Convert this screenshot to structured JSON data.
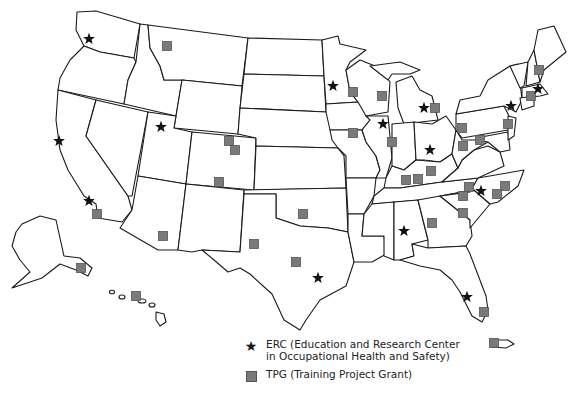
{
  "map": {
    "subject": "United States map with training program locations",
    "regions_shown": [
      "Contiguous United States",
      "Alaska",
      "Hawaii",
      "Puerto Rico"
    ]
  },
  "legend": {
    "items": [
      {
        "symbol": "star",
        "label_line1": "ERC (Education and Research Center",
        "label_line2": "in Occupational Health and Safety)"
      },
      {
        "symbol": "square",
        "label_line1": "TPG (Training Project Grant)"
      }
    ]
  },
  "colors": {
    "erc_marker": "#111111",
    "tpg_marker": "#7a7a7a",
    "state_border": "#1a1a1a",
    "background": "#ffffff"
  },
  "markers": {
    "erc": [
      {
        "region": "Washington",
        "x": 89,
        "y": 39
      },
      {
        "region": "Utah",
        "x": 161,
        "y": 127
      },
      {
        "region": "Northern California",
        "x": 59,
        "y": 141
      },
      {
        "region": "Southern California",
        "x": 89,
        "y": 201
      },
      {
        "region": "Minnesota",
        "x": 333,
        "y": 86
      },
      {
        "region": "Illinois",
        "x": 383,
        "y": 124
      },
      {
        "region": "Michigan",
        "x": 424,
        "y": 108
      },
      {
        "region": "Ohio",
        "x": 430,
        "y": 150
      },
      {
        "region": "New York",
        "x": 511,
        "y": 106
      },
      {
        "region": "Massachusetts",
        "x": 538,
        "y": 89
      },
      {
        "region": "North Carolina",
        "x": 481,
        "y": 191
      },
      {
        "region": "Alabama",
        "x": 404,
        "y": 231
      },
      {
        "region": "Texas",
        "x": 318,
        "y": 278
      },
      {
        "region": "Florida",
        "x": 467,
        "y": 297
      }
    ],
    "tpg": [
      {
        "region": "Montana",
        "x": 167,
        "y": 46
      },
      {
        "region": "Colorado 1",
        "x": 229,
        "y": 141
      },
      {
        "region": "Colorado 2",
        "x": 235,
        "y": 150
      },
      {
        "region": "New Mexico/Colorado",
        "x": 219,
        "y": 182
      },
      {
        "region": "Arizona",
        "x": 163,
        "y": 236
      },
      {
        "region": "California",
        "x": 97,
        "y": 214
      },
      {
        "region": "Alaska",
        "x": 81,
        "y": 268
      },
      {
        "region": "Hawaii",
        "x": 136,
        "y": 296
      },
      {
        "region": "Oklahoma",
        "x": 303,
        "y": 214
      },
      {
        "region": "Texas West",
        "x": 254,
        "y": 244
      },
      {
        "region": "Texas Central",
        "x": 296,
        "y": 262
      },
      {
        "region": "Wisconsin 1",
        "x": 353,
        "y": 92
      },
      {
        "region": "Wisconsin 2",
        "x": 382,
        "y": 96
      },
      {
        "region": "Iowa",
        "x": 353,
        "y": 133
      },
      {
        "region": "Illinois/Indiana",
        "x": 392,
        "y": 142
      },
      {
        "region": "Michigan",
        "x": 435,
        "y": 108
      },
      {
        "region": "Kentucky 1",
        "x": 406,
        "y": 180
      },
      {
        "region": "Kentucky 2",
        "x": 418,
        "y": 179
      },
      {
        "region": "Kentucky 3",
        "x": 431,
        "y": 171
      },
      {
        "region": "Pennsylvania West",
        "x": 462,
        "y": 128
      },
      {
        "region": "West Virginia",
        "x": 463,
        "y": 146
      },
      {
        "region": "Maryland",
        "x": 480,
        "y": 140
      },
      {
        "region": "New Jersey",
        "x": 508,
        "y": 124
      },
      {
        "region": "New Hampshire",
        "x": 539,
        "y": 70
      },
      {
        "region": "Connecticut",
        "x": 531,
        "y": 96
      },
      {
        "region": "North Carolina West",
        "x": 469,
        "y": 187
      },
      {
        "region": "North Carolina West 2",
        "x": 463,
        "y": 196
      },
      {
        "region": "North Carolina East 1",
        "x": 505,
        "y": 186
      },
      {
        "region": "North Carolina East 2",
        "x": 497,
        "y": 194
      },
      {
        "region": "South Carolina",
        "x": 463,
        "y": 213
      },
      {
        "region": "Georgia",
        "x": 432,
        "y": 223
      },
      {
        "region": "Florida",
        "x": 484,
        "y": 312
      },
      {
        "region": "Puerto Rico",
        "x": 494,
        "y": 343
      }
    ]
  }
}
